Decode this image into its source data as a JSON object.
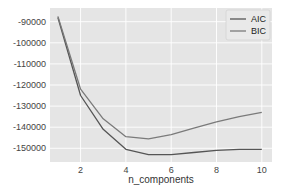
{
  "chart_data": {
    "type": "line",
    "title": "",
    "xlabel": "n_components",
    "ylabel": "",
    "x": [
      1,
      2,
      3,
      4,
      5,
      6,
      7,
      8,
      9,
      10
    ],
    "series": [
      {
        "name": "AIC",
        "color": "#555555",
        "values": [
          -88000,
          -125000,
          -141000,
          -150500,
          -153000,
          -153000,
          -152000,
          -151000,
          -150500,
          -150500
        ]
      },
      {
        "name": "BIC",
        "color": "#7a7a7a",
        "values": [
          -87500,
          -122000,
          -136000,
          -144500,
          -145500,
          -143500,
          -140500,
          -137500,
          -135000,
          -133000
        ]
      }
    ],
    "xticks": [
      2,
      4,
      6,
      8,
      10
    ],
    "yticks": [
      -90000,
      -100000,
      -110000,
      -120000,
      -130000,
      -140000,
      -150000
    ],
    "ytick_labels": [
      "-90000",
      "-100000",
      "-110000",
      "-120000",
      "-130000",
      "-140000",
      "-150000"
    ],
    "xlim": [
      0.65,
      10.45
    ],
    "ylim": [
      -156500,
      -83500
    ],
    "grid": true,
    "legend_position": "upper right",
    "background": "#e5e5e5",
    "grid_color": "#ffffff"
  }
}
